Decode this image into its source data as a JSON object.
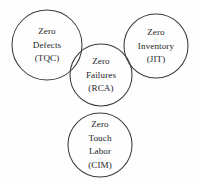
{
  "diagram": {
    "type": "venn-circles",
    "background_color": "#fefefe",
    "stroke_color": "#3b3b3f",
    "text_color": "#1d1d1f",
    "width": 200,
    "height": 187,
    "circles": [
      {
        "id": "zero-defects",
        "cx": 47,
        "cy": 45,
        "r": 35,
        "lines": [
          "Zero",
          "Defects",
          "(TQC)"
        ],
        "line1": "Zero",
        "line2": "Defects",
        "line3": "(TQC)",
        "acronym": "TQC",
        "text_cx": 47,
        "text_cy": 45
      },
      {
        "id": "zero-inventory",
        "cx": 156,
        "cy": 46,
        "r": 32,
        "lines": [
          "Zero",
          "Inventory",
          "(JIT)"
        ],
        "line1": "Zero",
        "line2": "Inventory",
        "line3": "(JIT)",
        "acronym": "JIT",
        "text_cx": 156,
        "text_cy": 46
      },
      {
        "id": "zero-failures",
        "cx": 101,
        "cy": 75,
        "r": 31,
        "lines": [
          "Zero",
          "Failures",
          "(RCA)"
        ],
        "line1": "Zero",
        "line2": "Failures",
        "line3": "(RCA)",
        "acronym": "RCA",
        "text_cx": 101,
        "text_cy": 75
      },
      {
        "id": "zero-touch-labor",
        "cx": 100,
        "cy": 145,
        "r": 32,
        "lines": [
          "Zero",
          "Touch",
          "Labor",
          "(CIM)"
        ],
        "line1": "Zero",
        "line2": "Touch",
        "line3": "Labor",
        "line4": "(CIM)",
        "acronym": "CIM",
        "text_cx": 100,
        "text_cy": 145
      }
    ]
  }
}
